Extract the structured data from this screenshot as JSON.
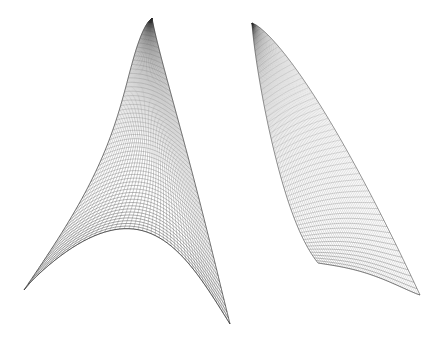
{
  "figure": {
    "title": "",
    "kind": "wireframe-mesh-surfaces",
    "background_color": "#ffffff",
    "line_color": "#2a2a2a",
    "width": 440,
    "height": 339,
    "caption": "",
    "surface_count": 2
  },
  "surfaces": [
    {
      "id": "left-surface",
      "name": "left-wireframe-surface",
      "description": "Broad curved sail-like wireframe sheet with a folded concave lower edge and a sharp apex at top",
      "apex": {
        "x": 152,
        "y": 18
      },
      "bounds": {
        "x_min": 24,
        "y_min": 16,
        "x_max": 231,
        "y_max": 325
      },
      "grid_u": 54,
      "grid_v": 46,
      "stroke_width": 0.45,
      "opacity": 0.9,
      "fold": true,
      "edge_tail": {
        "x": 229,
        "y": 322
      }
    },
    {
      "id": "right-surface",
      "name": "right-wireframe-surface",
      "description": "Narrow curved wedge wireframe sheet, concave trough along the lower-left boundary",
      "apex": {
        "x": 252,
        "y": 23
      },
      "bounds": {
        "x_min": 249,
        "y_min": 21,
        "x_max": 414,
        "y_max": 322
      },
      "grid_u": 52,
      "grid_v": 44,
      "stroke_width": 0.38,
      "opacity": 0.8,
      "fold": false,
      "edge_tail": {
        "x": 304,
        "y": 320
      }
    }
  ],
  "chart_data": {
    "type": "line",
    "title": "",
    "xlabel": "",
    "ylabel": "",
    "grid": false,
    "legend": "none",
    "series": [
      {
        "name": "left-surface-boundary",
        "values": [
          152,
          18,
          95,
          70,
          55,
          120,
          30,
          190,
          25,
          240,
          45,
          290,
          90,
          308,
          140,
          290,
          190,
          306,
          229,
          322
        ]
      },
      {
        "name": "left-surface-right-edge",
        "values": [
          152,
          18,
          178,
          90,
          200,
          160,
          215,
          230,
          229,
          322
        ]
      },
      {
        "name": "right-surface-boundary",
        "values": [
          252,
          23,
          270,
          90,
          285,
          160,
          296,
          235,
          304,
          320
        ]
      },
      {
        "name": "right-surface-right-edge",
        "values": [
          252,
          23,
          305,
          80,
          350,
          150,
          390,
          225,
          414,
          290
        ]
      }
    ]
  }
}
